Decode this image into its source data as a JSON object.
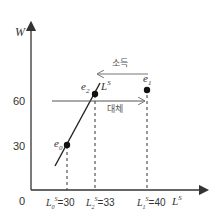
{
  "diagram": {
    "y_axis": {
      "label": "W",
      "ticks": [
        {
          "value": "60"
        },
        {
          "value": "30"
        }
      ]
    },
    "x_axis": {
      "label": "L",
      "label_sup": "S",
      "origin": "0"
    },
    "supply_curve": {
      "label": "L",
      "label_sup": "S"
    },
    "points": [
      {
        "id": "e0",
        "base": "e",
        "sub": "0"
      },
      {
        "id": "e1",
        "base": "e",
        "sub": "1"
      },
      {
        "id": "e2",
        "base": "e",
        "sub": "2"
      }
    ],
    "x_marks": [
      {
        "base": "L",
        "sub": "0",
        "sup": "S",
        "value": "=30"
      },
      {
        "base": "L",
        "sub": "2",
        "sup": "S",
        "value": "=33"
      },
      {
        "base": "L",
        "sub": "1",
        "sup": "S",
        "value": "=40"
      }
    ],
    "arrows": [
      {
        "name": "income-effect",
        "label": "소득"
      },
      {
        "name": "substitution-effect",
        "label": "대체"
      }
    ],
    "colors": {
      "axis": "#333333",
      "line": "#222222",
      "arrow_gray": "#888888"
    }
  }
}
